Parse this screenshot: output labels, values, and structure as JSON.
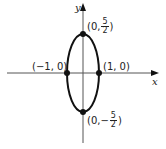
{
  "diagram": {
    "type": "ellipse-graph",
    "axes": {
      "x_label": "x",
      "y_label": "y"
    },
    "ellipse": {
      "center": [
        0,
        0
      ],
      "semi_axis_x": 1,
      "semi_axis_y": 2.5
    },
    "points": [
      {
        "id": "top",
        "label_prefix": "(0, ",
        "frac_sign": "",
        "frac_num": "5",
        "frac_den": "2",
        "label_suffix": ")"
      },
      {
        "id": "bottom",
        "label_prefix": "(0, ",
        "frac_sign": "−",
        "frac_num": "5",
        "frac_den": "2",
        "label_suffix": ")"
      },
      {
        "id": "left",
        "label": "(−1, 0)"
      },
      {
        "id": "right",
        "label": "(1, 0)"
      }
    ],
    "colors": {
      "stroke": "#111111",
      "axis": "#444444",
      "background": "#ffffff"
    }
  }
}
